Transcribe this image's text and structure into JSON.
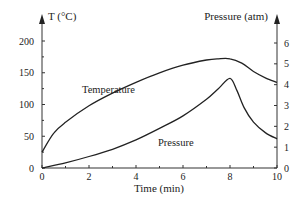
{
  "chart_data": {
    "type": "line",
    "title": "",
    "xlabel": "Time (min)",
    "ylabel_left": "T (°C)",
    "ylabel_right": "Pressure (atm)",
    "xlim": [
      0,
      10
    ],
    "ylim_left": [
      0,
      200
    ],
    "ylim_right": [
      0,
      6
    ],
    "x_ticks": [
      0,
      2,
      4,
      6,
      8,
      10
    ],
    "y_left_ticks": [
      0,
      50,
      100,
      150,
      200
    ],
    "y_right_ticks": [
      0,
      1,
      2,
      3,
      4,
      5,
      6
    ],
    "grid": false,
    "legend": "inline curve labels",
    "series": [
      {
        "name": "Temperature",
        "axis": "left",
        "x": [
          0,
          0.5,
          1,
          2,
          3,
          4,
          5,
          6,
          7,
          7.5,
          8,
          8.5,
          9,
          9.5,
          10
        ],
        "values": [
          25,
          55,
          72,
          98,
          118,
          135,
          150,
          162,
          170,
          172,
          172,
          165,
          152,
          142,
          135
        ]
      },
      {
        "name": "Pressure",
        "axis": "right",
        "x": [
          0,
          1,
          2,
          3,
          4,
          5,
          6,
          7,
          7.5,
          8,
          8.3,
          8.6,
          9,
          9.5,
          10
        ],
        "values": [
          0,
          0.25,
          0.55,
          0.9,
          1.35,
          1.9,
          2.5,
          3.3,
          3.8,
          4.3,
          3.7,
          2.9,
          2.2,
          1.7,
          1.4
        ]
      }
    ],
    "annotations": [
      {
        "text": "Temperature",
        "x": 2.9,
        "y_left": 112
      },
      {
        "text": "Pressure",
        "x": 5.0,
        "y_right": 1.2
      }
    ]
  },
  "labels": {
    "y_left_title": "T (°C)",
    "y_right_title": "Pressure (atm)",
    "x_title": "Time (min)",
    "temperature_label": "Temperature",
    "pressure_label": "Pressure"
  }
}
